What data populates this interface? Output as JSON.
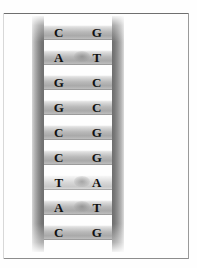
{
  "figure": {
    "background_color": "#fefefe",
    "frame_color": "#8a8a8a"
  },
  "ladder": {
    "rail_color_dark": "#6e6e6e",
    "rail_color_light": "#dcdcdc",
    "rung_count": 9,
    "rungs": [
      {
        "left": "C",
        "right": "G",
        "shade": "dark",
        "smudge": false
      },
      {
        "left": "A",
        "right": "T",
        "shade": "dark",
        "smudge": true
      },
      {
        "left": "G",
        "right": "C",
        "shade": "dark",
        "smudge": false
      },
      {
        "left": "G",
        "right": "C",
        "shade": "dark",
        "smudge": false
      },
      {
        "left": "C",
        "right": "G",
        "shade": "dark",
        "smudge": false
      },
      {
        "left": "C",
        "right": "G",
        "shade": "dark",
        "smudge": false
      },
      {
        "left": "T",
        "right": "A",
        "shade": "pale",
        "smudge": true
      },
      {
        "left": "A",
        "right": "T",
        "shade": "dark",
        "smudge": true
      },
      {
        "left": "C",
        "right": "G",
        "shade": "dark",
        "smudge": false
      }
    ]
  }
}
